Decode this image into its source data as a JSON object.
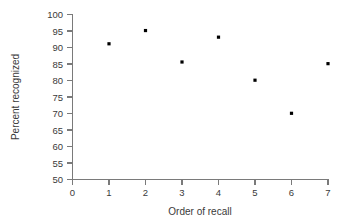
{
  "chart_data": {
    "type": "scatter",
    "title": "",
    "xlabel": "Order of recall",
    "ylabel": "Percent recognized",
    "x": [
      1,
      2,
      3,
      4,
      5,
      6,
      7
    ],
    "values": [
      91,
      95,
      85.5,
      93,
      80,
      70,
      85
    ],
    "categories": [
      "1",
      "2",
      "3",
      "4",
      "5",
      "6",
      "7"
    ],
    "xlim": [
      0,
      7
    ],
    "ylim": [
      50,
      100
    ],
    "xticks": [
      "0",
      "1",
      "2",
      "3",
      "4",
      "5",
      "6",
      "7"
    ],
    "yticks": [
      "50",
      "55",
      "60",
      "65",
      "70",
      "75",
      "80",
      "85",
      "90",
      "95",
      "100"
    ],
    "grid": false,
    "legend": false,
    "marker": "square",
    "marker_color": "#000000",
    "axis_color": "#7a7a7a",
    "text_color": "#3a3a3a"
  }
}
